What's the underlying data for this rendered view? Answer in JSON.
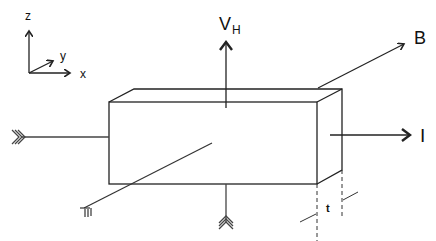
{
  "diagram": {
    "axes": {
      "z": "z",
      "y": "y",
      "x": "x"
    },
    "labels": {
      "hall_voltage": "V",
      "hall_voltage_sub": "H",
      "magnetic_field": "B",
      "current": "I",
      "thickness": "t"
    },
    "colors": {
      "line": "#222222",
      "background": "#ffffff"
    }
  }
}
